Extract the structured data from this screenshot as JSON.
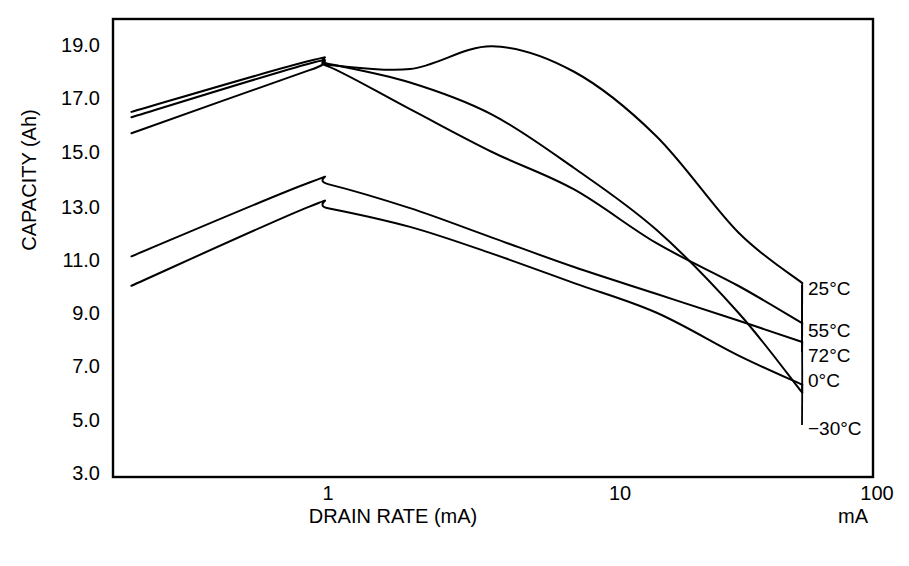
{
  "chart_data": {
    "type": "line",
    "title": "",
    "xlabel": "DRAIN RATE (mA)",
    "ylabel": "CAPACITY (Ah)",
    "x_unit_note": "mA",
    "xscale": "log",
    "xlim": [
      0.19,
      100
    ],
    "ylim": [
      3.0,
      19.8
    ],
    "grid": false,
    "legend_position": "right-inline-labels",
    "xticks": [
      "1",
      "10",
      "100"
    ],
    "xtick_values": [
      1,
      10,
      100
    ],
    "yticks": [
      "3.0",
      "5.0",
      "7.0",
      "9.0",
      "11.0",
      "13.0",
      "15.0",
      "17.0",
      "19.0"
    ],
    "ytick_values": [
      3.0,
      5.0,
      7.0,
      9.0,
      11.0,
      13.0,
      15.0,
      17.0,
      19.0
    ],
    "series": [
      {
        "name": "25°C",
        "label": "25°C",
        "x": [
          0.19,
          0.85,
          1.0,
          2.0,
          4.0,
          8.0,
          16.0,
          32.0,
          55.0
        ],
        "values": [
          16.5,
          18.4,
          18.3,
          17.6,
          16.4,
          14.4,
          12.1,
          9.0,
          6.0
        ]
      },
      {
        "name": "55°C",
        "label": "55°C",
        "x": [
          0.19,
          0.85,
          1.0,
          2.0,
          4.0,
          8.0,
          16.0,
          32.0,
          55.0
        ],
        "values": [
          16.3,
          18.3,
          18.25,
          18.1,
          18.95,
          18.0,
          15.6,
          12.0,
          10.1
        ]
      },
      {
        "name": "72°C",
        "label": "72°C",
        "x": [
          0.19,
          0.85,
          1.0,
          2.0,
          4.0,
          8.0,
          16.0,
          32.0,
          55.0
        ],
        "values": [
          15.7,
          18.05,
          18.2,
          16.6,
          15.0,
          13.6,
          11.6,
          10.0,
          8.6
        ]
      },
      {
        "name": "0°C",
        "label": "0°C",
        "x": [
          0.19,
          0.85,
          1.0,
          2.0,
          4.0,
          8.0,
          16.0,
          32.0,
          55.0
        ],
        "values": [
          11.1,
          13.85,
          13.8,
          12.9,
          11.8,
          10.7,
          9.7,
          8.7,
          7.9
        ]
      },
      {
        "name": "−30°C",
        "label": "−30°C",
        "x": [
          0.19,
          0.85,
          1.0,
          2.0,
          4.0,
          8.0,
          16.0,
          32.0,
          55.0
        ],
        "values": [
          10.0,
          12.95,
          12.9,
          12.2,
          11.2,
          10.1,
          9.0,
          7.4,
          6.3
        ]
      }
    ]
  },
  "axes": {
    "y_title": "CAPACITY (Ah)",
    "x_title": "DRAIN RATE (mA)",
    "x_unit": "mA"
  }
}
